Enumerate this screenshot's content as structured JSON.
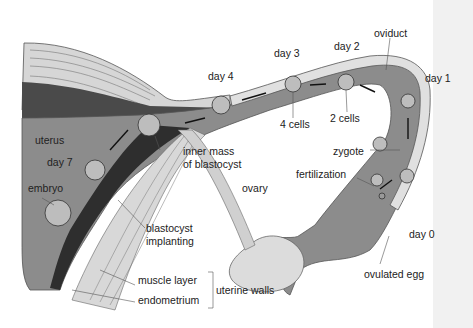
{
  "diagram": {
    "colors": {
      "background": "#ffffff",
      "side_panel": "#f1f1f1",
      "oviduct_lumen": "#8a8a8a",
      "wall_light": "#d8d8d8",
      "endometrium_dark": "#3a3a3a",
      "ovary": "#dcdcdc",
      "text": "#222222"
    },
    "labels": {
      "oviduct": "oviduct",
      "day1": "day 1",
      "day2": "day 2",
      "day3": "day 3",
      "day4": "day 4",
      "day7": "day 7",
      "day0": "day 0",
      "uterus": "uterus",
      "cells2": "2 cells",
      "cells4": "4 cells",
      "zygote": "zygote",
      "fertilization": "fertilization",
      "inner_mass_line1": "inner mass",
      "inner_mass_line2": "of blastocyst",
      "ovary": "ovary",
      "embryo": "embryo",
      "blastocyst_line1": "blastocyst",
      "blastocyst_line2": "implanting",
      "ovulated_egg": "ovulated egg",
      "muscle_layer": "muscle layer",
      "endometrium": "endometrium",
      "uterine_walls": "uterine walls"
    },
    "stages": [
      {
        "day": "day 0",
        "stage": "ovulated egg"
      },
      {
        "day": "day 0",
        "stage": "fertilization"
      },
      {
        "day": "day 1",
        "stage": "zygote"
      },
      {
        "day": "day 2",
        "stage": "2 cells"
      },
      {
        "day": "day 3",
        "stage": "4 cells"
      },
      {
        "day": "day 4",
        "stage": "morula"
      },
      {
        "day": "day 7",
        "stage": "blastocyst implanting"
      }
    ]
  }
}
